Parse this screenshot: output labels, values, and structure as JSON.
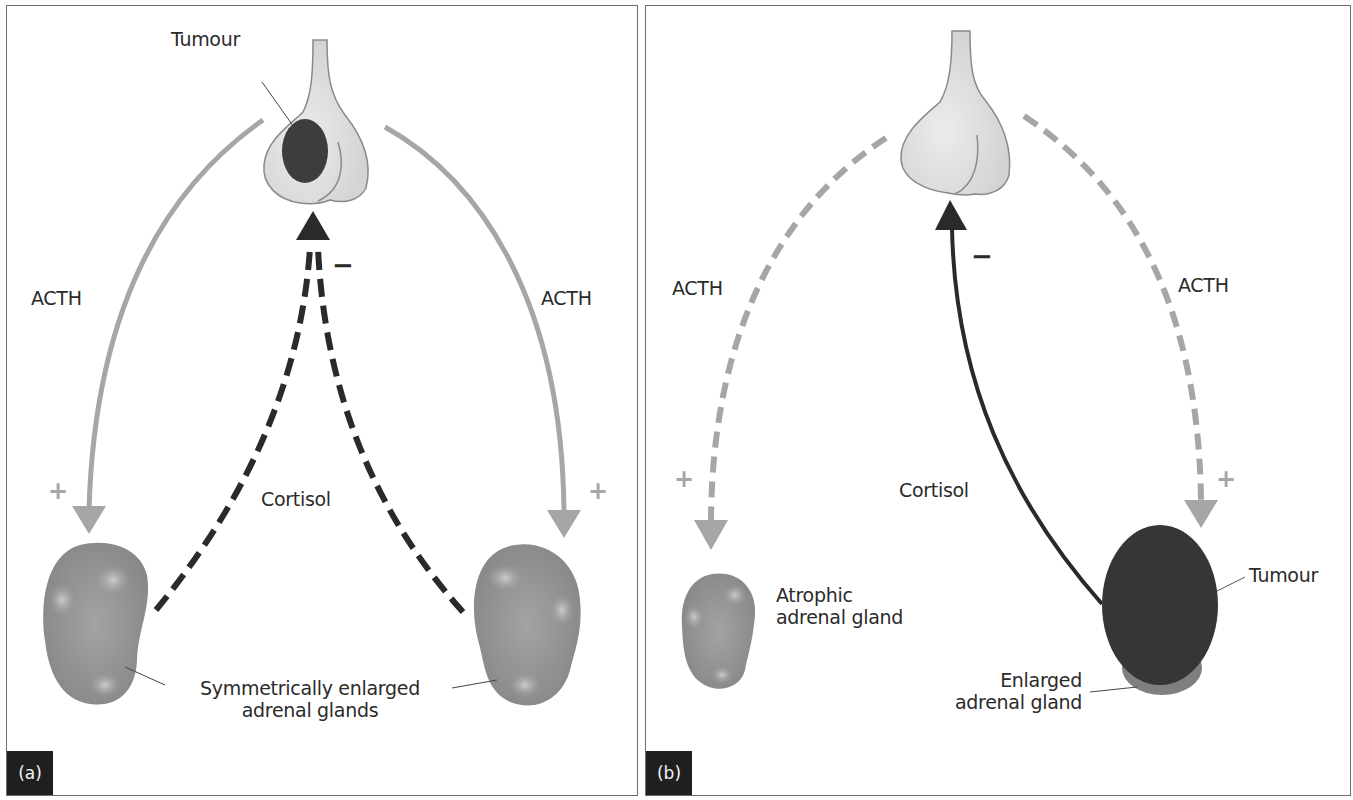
{
  "figure": {
    "panels": [
      {
        "id": "a",
        "tag": "(a)",
        "labels": {
          "tumour": "Tumour",
          "acth_left": "ACTH",
          "acth_right": "ACTH",
          "cortisol": "Cortisol",
          "glands_line1": "Symmetrically enlarged",
          "glands_line2": "adrenal glands",
          "plus_left": "+",
          "plus_right": "+",
          "minus": "−"
        }
      },
      {
        "id": "b",
        "tag": "(b)",
        "labels": {
          "acth_left": "ACTH",
          "acth_right": "ACTH",
          "cortisol": "Cortisol",
          "atrophic_line1": "Atrophic",
          "atrophic_line2": "adrenal gland",
          "tumour": "Tumour",
          "enlarged_line1": "Enlarged",
          "enlarged_line2": "adrenal gland",
          "plus_left": "+",
          "plus_right": "+",
          "minus": "−"
        }
      }
    ],
    "colors": {
      "acth_arrow": "#a6a6a6",
      "cortisol_arrow": "#2a2a2a",
      "pituitary_fill": "#d9d9d9",
      "pituitary_stroke": "#8c8c8c",
      "tumour_fill": "#3a3a3a",
      "gland_fill": "#8f8f8f",
      "border": "#6e6e6e"
    }
  }
}
